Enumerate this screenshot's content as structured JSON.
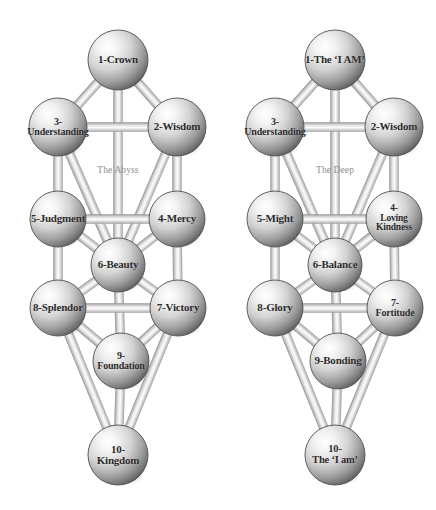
{
  "canvas": {
    "width": 436,
    "height": 510,
    "background": "#ffffff"
  },
  "style": {
    "sphere_light": "#fdfdfd",
    "sphere_mid": "#c9c9c9",
    "sphere_dark": "#6d6d6d",
    "sphere_edge": "#4a4a4a",
    "path_light": "#f4f4f4",
    "path_mid": "#d4d4d4",
    "path_dark": "#9a9a9a",
    "text_color": "#2b2b2b",
    "veil_color": "#8e8e8e"
  },
  "diagrams": [
    {
      "id": "left-tree",
      "name": "traditional-tree-of-life",
      "veil": {
        "label": "The Abyss",
        "x": 118,
        "y": 170
      },
      "spheres": [
        {
          "id": "s1",
          "label": "1-Crown",
          "x": 118,
          "y": 60,
          "r": 30,
          "font": 11
        },
        {
          "id": "s2",
          "label": "2-Wisdom",
          "x": 177,
          "y": 127,
          "r": 29,
          "font": 11
        },
        {
          "id": "s3",
          "label": "3-\nUnderstanding",
          "x": 58,
          "y": 127,
          "r": 29,
          "font": 10
        },
        {
          "id": "s4",
          "label": "4-Mercy",
          "x": 177,
          "y": 219,
          "r": 28,
          "font": 11
        },
        {
          "id": "s5",
          "label": "5-Judgment",
          "x": 58,
          "y": 219,
          "r": 28,
          "font": 11
        },
        {
          "id": "s6",
          "label": "6-Beauty",
          "x": 118,
          "y": 265,
          "r": 27,
          "font": 11
        },
        {
          "id": "s7",
          "label": "7-Victory",
          "x": 178,
          "y": 308,
          "r": 28,
          "font": 11
        },
        {
          "id": "s8",
          "label": "8-Splendor",
          "x": 58,
          "y": 308,
          "r": 28,
          "font": 11
        },
        {
          "id": "s9",
          "label": "9-\nFoundation",
          "x": 121,
          "y": 361,
          "r": 28,
          "font": 10
        },
        {
          "id": "s10",
          "label": "10-\nKingdom",
          "x": 118,
          "y": 455,
          "r": 30,
          "font": 11
        }
      ],
      "paths": [
        [
          "s1",
          "s2"
        ],
        [
          "s1",
          "s3"
        ],
        [
          "s1",
          "s6"
        ],
        [
          "s2",
          "s3"
        ],
        [
          "s2",
          "s4"
        ],
        [
          "s2",
          "s6"
        ],
        [
          "s3",
          "s5"
        ],
        [
          "s3",
          "s6"
        ],
        [
          "s4",
          "s5"
        ],
        [
          "s4",
          "s6"
        ],
        [
          "s4",
          "s7"
        ],
        [
          "s5",
          "s6"
        ],
        [
          "s5",
          "s8"
        ],
        [
          "s6",
          "s7"
        ],
        [
          "s6",
          "s8"
        ],
        [
          "s6",
          "s9"
        ],
        [
          "s7",
          "s8"
        ],
        [
          "s7",
          "s9"
        ],
        [
          "s7",
          "s10"
        ],
        [
          "s8",
          "s9"
        ],
        [
          "s8",
          "s10"
        ],
        [
          "s9",
          "s10"
        ]
      ]
    },
    {
      "id": "right-tree",
      "name": "alternate-tree-of-life",
      "veil": {
        "label": "The Deep",
        "x": 335,
        "y": 170
      },
      "spheres": [
        {
          "id": "s1",
          "label": "1-The ‘I AM’",
          "x": 335,
          "y": 60,
          "r": 30,
          "font": 11
        },
        {
          "id": "s2",
          "label": "2-Wisdom",
          "x": 394,
          "y": 127,
          "r": 29,
          "font": 11
        },
        {
          "id": "s3",
          "label": "3-\nUnderstanding",
          "x": 275,
          "y": 127,
          "r": 29,
          "font": 10
        },
        {
          "id": "s4",
          "label": "4-\nLoving\nKindness",
          "x": 394,
          "y": 219,
          "r": 28,
          "font": 9.5
        },
        {
          "id": "s5",
          "label": "5-Might",
          "x": 275,
          "y": 219,
          "r": 28,
          "font": 11
        },
        {
          "id": "s6",
          "label": "6-Balance",
          "x": 335,
          "y": 265,
          "r": 27,
          "font": 11
        },
        {
          "id": "s7",
          "label": "7-\nFortitude",
          "x": 395,
          "y": 308,
          "r": 28,
          "font": 10
        },
        {
          "id": "s8",
          "label": "8-Glory",
          "x": 275,
          "y": 308,
          "r": 28,
          "font": 11
        },
        {
          "id": "s9",
          "label": "9-Bonding",
          "x": 338,
          "y": 361,
          "r": 28,
          "font": 11
        },
        {
          "id": "s10",
          "label": "10-\nThe ‘I am’",
          "x": 335,
          "y": 455,
          "r": 30,
          "font": 10.5
        }
      ],
      "paths": [
        [
          "s1",
          "s2"
        ],
        [
          "s1",
          "s3"
        ],
        [
          "s1",
          "s6"
        ],
        [
          "s2",
          "s3"
        ],
        [
          "s2",
          "s4"
        ],
        [
          "s2",
          "s6"
        ],
        [
          "s3",
          "s5"
        ],
        [
          "s3",
          "s6"
        ],
        [
          "s4",
          "s5"
        ],
        [
          "s4",
          "s6"
        ],
        [
          "s4",
          "s7"
        ],
        [
          "s5",
          "s6"
        ],
        [
          "s5",
          "s8"
        ],
        [
          "s6",
          "s7"
        ],
        [
          "s6",
          "s8"
        ],
        [
          "s6",
          "s9"
        ],
        [
          "s7",
          "s8"
        ],
        [
          "s7",
          "s9"
        ],
        [
          "s7",
          "s10"
        ],
        [
          "s8",
          "s9"
        ],
        [
          "s8",
          "s10"
        ],
        [
          "s9",
          "s10"
        ]
      ]
    }
  ]
}
